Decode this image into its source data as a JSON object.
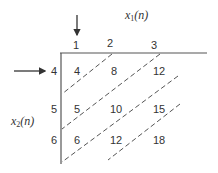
{
  "axis_labels": {
    "x1": {
      "base": "x",
      "sub": "1",
      "arg": "(n)"
    },
    "x2": {
      "base": "x",
      "sub": "2",
      "arg": "(n)"
    }
  },
  "x1_values": [
    "1",
    "2",
    "3"
  ],
  "x2_values": [
    "4",
    "5",
    "6"
  ],
  "products": [
    [
      "4",
      "8",
      "12"
    ],
    [
      "5",
      "10",
      "15"
    ],
    [
      "6",
      "12",
      "18"
    ]
  ],
  "colors": {
    "line": "#555555",
    "text": "#333333"
  }
}
